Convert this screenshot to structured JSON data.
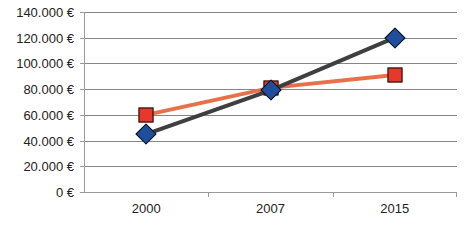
{
  "chart_data": {
    "type": "line",
    "title": "",
    "xlabel": "",
    "ylabel": "",
    "categories": [
      "2000",
      "2007",
      "2015"
    ],
    "ylim": [
      0,
      140000
    ],
    "ytick_values": [
      0,
      20000,
      40000,
      60000,
      80000,
      100000,
      120000,
      140000
    ],
    "ytick_labels": [
      "0 €",
      "20.000 €",
      "40.000 €",
      "60.000 €",
      "80.000 €",
      "100.000 €",
      "120.000 €",
      "140.000 €"
    ],
    "grid": "horizontal",
    "legend": "none",
    "series": [
      {
        "name": "series-1",
        "values": [
          45000,
          79000,
          120000
        ],
        "line_color": "#3f3f3f",
        "marker_color": "#1f4e9c",
        "marker_shape": "diamond"
      },
      {
        "name": "series-2",
        "values": [
          60000,
          81000,
          91000
        ],
        "line_color": "#e8704a",
        "marker_color": "#e8372b",
        "marker_shape": "square"
      }
    ]
  },
  "colors": {
    "gridline": "#868686",
    "axis": "#9a9a9a",
    "background": "#ffffff",
    "text": "#222222"
  }
}
